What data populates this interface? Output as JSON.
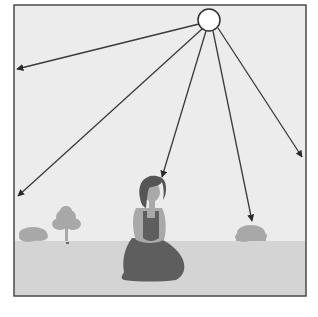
{
  "diagram": {
    "colors": {
      "background": "#ffffff",
      "sky": "#ececec",
      "ground": "#d4d4d4",
      "frame": "#4a4a4a",
      "ray": "#3a3a3a",
      "sun_fill": "#ffffff",
      "vegetation": "#a8a8a8",
      "hair": "#555555",
      "skin": "#a9a9a9",
      "dress": "#5e5e5e"
    },
    "frame": {
      "x": 14,
      "y": 5,
      "width": 292,
      "height": 291
    },
    "horizon_y": 241,
    "sun": {
      "cx": 209,
      "cy": 20,
      "r": 11,
      "label": ""
    },
    "rays": [
      {
        "name": "ray-left",
        "x1": 199,
        "y1": 24,
        "x2": 17,
        "y2": 69
      },
      {
        "name": "ray-lower-left",
        "x1": 202,
        "y1": 29,
        "x2": 18,
        "y2": 196
      },
      {
        "name": "ray-center",
        "x1": 206,
        "y1": 31,
        "x2": 162,
        "y2": 177
      },
      {
        "name": "ray-right-center",
        "x1": 213,
        "y1": 31,
        "x2": 252,
        "y2": 221
      },
      {
        "name": "ray-far-right",
        "x1": 218,
        "y1": 28,
        "x2": 302,
        "y2": 157
      }
    ]
  }
}
